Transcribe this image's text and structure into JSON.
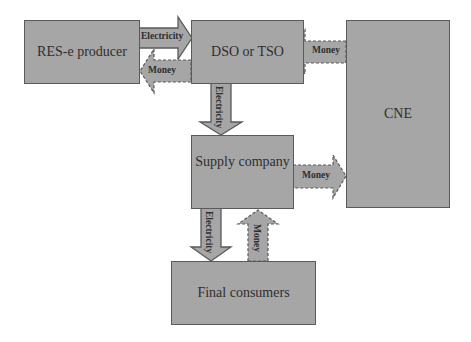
{
  "diagram": {
    "nodes": [
      {
        "id": "res_e_producer",
        "label": "RES-e producer"
      },
      {
        "id": "dso_tso",
        "label": "DSO or TSO"
      },
      {
        "id": "cne",
        "label": "CNE"
      },
      {
        "id": "supply_company",
        "label": "Supply company"
      },
      {
        "id": "final_consumers",
        "label": "Final consumers"
      }
    ],
    "edges": [
      {
        "from": "res_e_producer",
        "to": "dso_tso",
        "label": "Electricity",
        "style": "solid"
      },
      {
        "from": "dso_tso",
        "to": "res_e_producer",
        "label": "Money",
        "style": "dashed"
      },
      {
        "from": "cne",
        "to": "dso_tso",
        "label": "Money",
        "style": "dashed"
      },
      {
        "from": "dso_tso",
        "to": "supply_company",
        "label": "Electricity",
        "style": "solid"
      },
      {
        "from": "supply_company",
        "to": "cne",
        "label": "Money",
        "style": "dashed"
      },
      {
        "from": "supply_company",
        "to": "final_consumers",
        "label": "Electricity",
        "style": "solid"
      },
      {
        "from": "final_consumers",
        "to": "supply_company",
        "label": "Money",
        "style": "dashed"
      }
    ],
    "colors": {
      "box_fill": "#a6a6a6",
      "border": "#5a5a5a",
      "text": "#2e2e2e"
    }
  }
}
